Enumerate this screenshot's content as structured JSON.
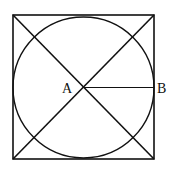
{
  "diagram": {
    "square": {
      "x": 13,
      "y": 15,
      "size": 141
    },
    "circle": {
      "cx": 83.5,
      "cy": 87.5,
      "r": 70
    },
    "points": {
      "A": {
        "label": "A",
        "x": 83.5,
        "y": 87.5
      },
      "B": {
        "label": "B",
        "x": 153.5,
        "y": 87.5
      }
    },
    "segments": [
      "diagonal-1",
      "diagonal-2",
      "AB"
    ],
    "stroke_color": "#111111"
  }
}
